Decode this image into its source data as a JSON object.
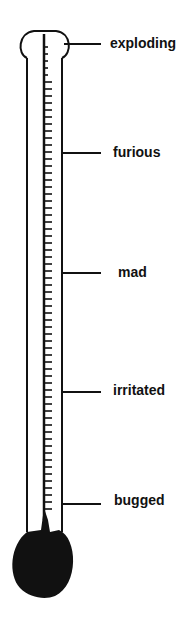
{
  "diagram": {
    "type": "anger-thermometer",
    "levels": [
      {
        "label": "exploding",
        "y": 44
      },
      {
        "label": "furious",
        "y": 153
      },
      {
        "label": "mad",
        "y": 273
      },
      {
        "label": "irritated",
        "y": 392
      },
      {
        "label": "bugged",
        "y": 504
      }
    ],
    "colors": {
      "ink": "#111111",
      "background": "#ffffff"
    }
  }
}
